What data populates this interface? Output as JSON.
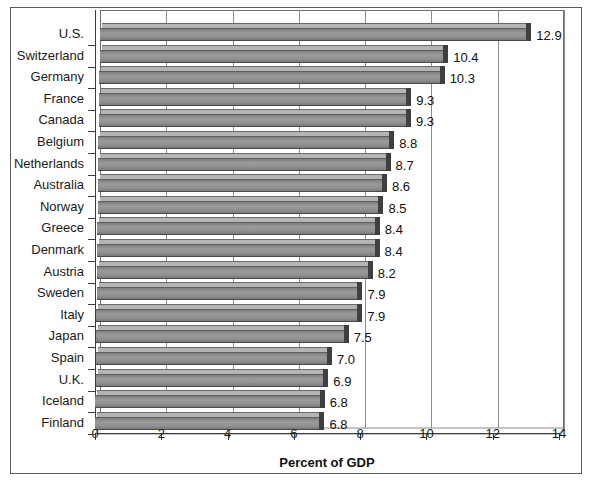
{
  "chart_data": {
    "type": "bar",
    "orientation": "horizontal",
    "title": "",
    "subtitle": "",
    "xlabel": "Percent of GDP",
    "ylabel": "",
    "xlim": [
      0,
      14
    ],
    "xticks": [
      0,
      2,
      4,
      6,
      8,
      10,
      12,
      14
    ],
    "xticklabels": [
      "0",
      "2",
      "4",
      "6",
      "8",
      "10",
      "12",
      "14"
    ],
    "grid": true,
    "grid_axis": "x",
    "legend": false,
    "legend_position": "none",
    "style": "3d-bar",
    "bar_color": "#8e8e8e",
    "categories": [
      "U.S.",
      "Switzerland",
      "Germany",
      "France",
      "Canada",
      "Belgium",
      "Netherlands",
      "Australia",
      "Norway",
      "Greece",
      "Denmark",
      "Austria",
      "Sweden",
      "Italy",
      "Japan",
      "Spain",
      "U.K.",
      "Iceland",
      "Finland"
    ],
    "values": [
      12.9,
      10.4,
      10.3,
      9.3,
      9.3,
      8.8,
      8.7,
      8.6,
      8.5,
      8.4,
      8.4,
      8.2,
      7.9,
      7.9,
      7.5,
      7.0,
      6.9,
      6.8,
      6.8
    ],
    "data_labels": [
      "12.9",
      "10.4",
      "10.3",
      "9.3",
      "9.3",
      "8.8",
      "8.7",
      "8.6",
      "8.5",
      "8.4",
      "8.4",
      "8.2",
      "7.9",
      "7.9",
      "7.5",
      "7.0",
      "6.9",
      "6.8",
      "6.8"
    ]
  }
}
